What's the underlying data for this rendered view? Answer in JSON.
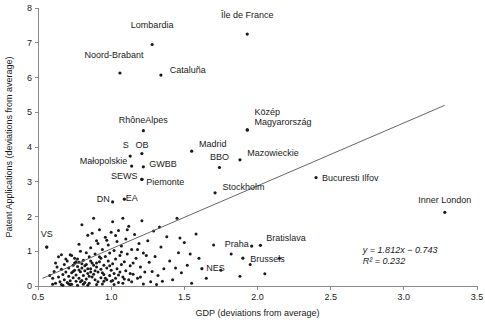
{
  "chart_data": {
    "type": "scatter",
    "title": "",
    "xlabel": "GDP (deviations from average)",
    "ylabel": "Patent Applications (deviations from average)",
    "xlim": [
      0.5,
      3.5
    ],
    "ylim": [
      0,
      8
    ],
    "xticks": [
      0.5,
      1.0,
      1.5,
      2.0,
      2.5,
      3.0,
      3.5
    ],
    "xticklabels": [
      "0.5",
      "1.0",
      "1.5",
      "2.0",
      "2.5",
      "3.0",
      "3.5"
    ],
    "yticks": [
      0,
      1,
      2,
      3,
      4,
      5,
      6,
      7,
      8
    ],
    "yticklabels": [
      "0",
      "1",
      "2",
      "3",
      "4",
      "5",
      "6",
      "7",
      "8"
    ],
    "grid": false,
    "legend": "none",
    "trendline": {
      "equation": "y = 1.812x − 0.743",
      "r2": "R² = 0.232",
      "slope": 1.812,
      "intercept": -0.743,
      "x_start": 0.53,
      "x_end": 3.28
    },
    "annotations": {
      "equation_line1": "y = 1.812x − 0.743",
      "equation_line2": "R² = 0.232"
    },
    "labeled_points": [
      {
        "label": "Île de France",
        "x": 1.93,
        "y": 7.25,
        "lx": 1.93,
        "ly": 7.72,
        "anchor": "middle"
      },
      {
        "label": "Lombardia",
        "x": 1.28,
        "y": 6.95,
        "lx": 1.28,
        "ly": 7.42,
        "anchor": "middle"
      },
      {
        "label": "Noord-Brabant",
        "x": 1.06,
        "y": 6.13,
        "lx": 1.02,
        "ly": 6.55,
        "anchor": "middle"
      },
      {
        "label": "Cataluña",
        "x": 1.34,
        "y": 6.07,
        "lx": 1.4,
        "ly": 6.13,
        "anchor": "start"
      },
      {
        "label": "Közép",
        "x": 1.93,
        "y": 4.49,
        "lx": 1.98,
        "ly": 4.92,
        "anchor": "start"
      },
      {
        "label": "Magyarország",
        "x": 1.93,
        "y": 4.49,
        "lx": 1.98,
        "ly": 4.62,
        "anchor": "start"
      },
      {
        "label": "RhôneAlpes",
        "x": 1.22,
        "y": 4.47,
        "lx": 1.22,
        "ly": 4.68,
        "anchor": "middle"
      },
      {
        "label": "Madrid",
        "x": 1.55,
        "y": 3.88,
        "lx": 1.6,
        "ly": 3.99,
        "anchor": "start"
      },
      {
        "label": "OB",
        "x": 1.21,
        "y": 3.81,
        "lx": 1.21,
        "ly": 3.98,
        "anchor": "middle"
      },
      {
        "label": "S",
        "x": 1.13,
        "y": 3.74,
        "lx": 1.1,
        "ly": 3.97,
        "anchor": "middle"
      },
      {
        "label": "Mazowieckie",
        "x": 1.88,
        "y": 3.63,
        "lx": 1.93,
        "ly": 3.74,
        "anchor": "start"
      },
      {
        "label": "BBO",
        "x": 1.74,
        "y": 3.41,
        "lx": 1.74,
        "ly": 3.62,
        "anchor": "middle"
      },
      {
        "label": "Małopolskie",
        "x": 1.14,
        "y": 3.45,
        "lx": 1.11,
        "ly": 3.5,
        "anchor": "end"
      },
      {
        "label": "GWBB",
        "x": 1.22,
        "y": 3.43,
        "lx": 1.26,
        "ly": 3.43,
        "anchor": "start"
      },
      {
        "label": "Bucuresti Ilfov",
        "x": 2.4,
        "y": 3.12,
        "lx": 2.44,
        "ly": 3.02,
        "anchor": "start"
      },
      {
        "label": "SEWS",
        "x": 1.21,
        "y": 3.07,
        "lx": 1.18,
        "ly": 3.07,
        "anchor": "end"
      },
      {
        "label": "Piemonte",
        "x": 1.21,
        "y": 3.07,
        "lx": 1.24,
        "ly": 2.92,
        "anchor": "start"
      },
      {
        "label": "Stockholm",
        "x": 1.71,
        "y": 2.68,
        "lx": 1.76,
        "ly": 2.75,
        "anchor": "start"
      },
      {
        "label": "Inner London",
        "x": 3.28,
        "y": 2.12,
        "lx": 3.28,
        "ly": 2.4,
        "anchor": "middle"
      },
      {
        "label": "EA",
        "x": 1.09,
        "y": 2.5,
        "lx": 1.1,
        "ly": 2.44,
        "anchor": "start"
      },
      {
        "label": "DN",
        "x": 1.01,
        "y": 2.42,
        "lx": 0.99,
        "ly": 2.42,
        "anchor": "end"
      },
      {
        "label": "VS",
        "x": 0.56,
        "y": 1.12,
        "lx": 0.56,
        "ly": 1.4,
        "anchor": "middle"
      },
      {
        "label": "Bratislava",
        "x": 2.02,
        "y": 1.17,
        "lx": 2.06,
        "ly": 1.3,
        "anchor": "start"
      },
      {
        "label": "Praha",
        "x": 1.96,
        "y": 1.15,
        "lx": 1.94,
        "ly": 1.11,
        "anchor": "end"
      },
      {
        "label": "Brussels",
        "x": 1.9,
        "y": 0.8,
        "lx": 1.95,
        "ly": 0.7,
        "anchor": "start"
      },
      {
        "label": "NES",
        "x": 1.62,
        "y": 0.5,
        "lx": 1.65,
        "ly": 0.42,
        "anchor": "start"
      }
    ],
    "points": [
      [
        0.56,
        1.12
      ],
      [
        0.58,
        0.3
      ],
      [
        0.6,
        0.22
      ],
      [
        0.61,
        0.42
      ],
      [
        0.62,
        0.08
      ],
      [
        0.63,
        0.55
      ],
      [
        0.64,
        0.26
      ],
      [
        0.65,
        0.12
      ],
      [
        0.66,
        0.48
      ],
      [
        0.66,
        0.04
      ],
      [
        0.67,
        0.33
      ],
      [
        0.68,
        0.62
      ],
      [
        0.68,
        0.18
      ],
      [
        0.69,
        0.4
      ],
      [
        0.7,
        0.1
      ],
      [
        0.7,
        0.72
      ],
      [
        0.71,
        0.28
      ],
      [
        0.71,
        0.52
      ],
      [
        0.72,
        0.15
      ],
      [
        0.72,
        0.9
      ],
      [
        0.73,
        0.38
      ],
      [
        0.73,
        0.05
      ],
      [
        0.74,
        0.6
      ],
      [
        0.74,
        0.24
      ],
      [
        0.75,
        0.45
      ],
      [
        0.75,
        0.8
      ],
      [
        0.76,
        0.14
      ],
      [
        0.76,
        0.32
      ],
      [
        0.77,
        0.56
      ],
      [
        0.77,
        0.02
      ],
      [
        0.78,
        0.68
      ],
      [
        0.78,
        0.22
      ],
      [
        0.79,
        1.0
      ],
      [
        0.79,
        0.41
      ],
      [
        0.8,
        0.16
      ],
      [
        0.8,
        0.52
      ],
      [
        0.8,
        1.76
      ],
      [
        0.81,
        0.3
      ],
      [
        0.81,
        0.74
      ],
      [
        0.82,
        0.1
      ],
      [
        0.82,
        0.44
      ],
      [
        0.83,
        0.62
      ],
      [
        0.83,
        0.2
      ],
      [
        0.84,
        1.46
      ],
      [
        0.84,
        0.36
      ],
      [
        0.85,
        0.84
      ],
      [
        0.85,
        0.08
      ],
      [
        0.86,
        0.5
      ],
      [
        0.86,
        1.1
      ],
      [
        0.87,
        0.26
      ],
      [
        0.87,
        0.66
      ],
      [
        0.88,
        1.95
      ],
      [
        0.88,
        0.34
      ],
      [
        0.89,
        0.18
      ],
      [
        0.89,
        0.92
      ],
      [
        0.9,
        0.55
      ],
      [
        0.9,
        1.3
      ],
      [
        0.91,
        0.12
      ],
      [
        0.91,
        0.4
      ],
      [
        0.92,
        0.7
      ],
      [
        0.92,
        1.62
      ],
      [
        0.93,
        0.24
      ],
      [
        0.93,
        0.48
      ],
      [
        0.94,
        1.05
      ],
      [
        0.94,
        0.06
      ],
      [
        0.95,
        0.6
      ],
      [
        0.95,
        0.33
      ],
      [
        0.96,
        1.4
      ],
      [
        0.96,
        0.85
      ],
      [
        0.97,
        0.18
      ],
      [
        0.97,
        0.52
      ],
      [
        0.98,
        0.72
      ],
      [
        0.98,
        1.18
      ],
      [
        0.99,
        0.3
      ],
      [
        0.99,
        0.95
      ],
      [
        1.0,
        0.45
      ],
      [
        1.0,
        1.55
      ],
      [
        1.0,
        0.14
      ],
      [
        1.01,
        0.64
      ],
      [
        1.01,
        1.85
      ],
      [
        1.02,
        0.36
      ],
      [
        1.02,
        1.02
      ],
      [
        1.03,
        0.22
      ],
      [
        1.03,
        0.78
      ],
      [
        1.04,
        1.28
      ],
      [
        1.04,
        0.5
      ],
      [
        1.05,
        1.6
      ],
      [
        1.05,
        0.1
      ],
      [
        1.06,
        0.88
      ],
      [
        1.06,
        0.4
      ],
      [
        1.07,
        1.15
      ],
      [
        1.07,
        0.62
      ],
      [
        1.08,
        0.26
      ],
      [
        1.08,
        1.95
      ],
      [
        1.09,
        0.7
      ],
      [
        1.1,
        1.35
      ],
      [
        1.1,
        0.44
      ],
      [
        1.11,
        0.92
      ],
      [
        1.12,
        0.18
      ],
      [
        1.12,
        1.72
      ],
      [
        1.13,
        0.58
      ],
      [
        1.14,
        1.05
      ],
      [
        1.15,
        0.34
      ],
      [
        1.16,
        1.48
      ],
      [
        1.17,
        0.8
      ],
      [
        1.18,
        0.22
      ],
      [
        1.19,
        1.22
      ],
      [
        1.2,
        0.55
      ],
      [
        1.21,
        1.88
      ],
      [
        1.22,
        0.95
      ],
      [
        1.23,
        0.4
      ],
      [
        1.25,
        1.3
      ],
      [
        1.26,
        0.68
      ],
      [
        1.27,
        0.12
      ],
      [
        1.29,
        1.58
      ],
      [
        1.3,
        0.85
      ],
      [
        1.32,
        0.3
      ],
      [
        1.34,
        1.12
      ],
      [
        1.36,
        0.5
      ],
      [
        1.38,
        1.42
      ],
      [
        1.4,
        0.72
      ],
      [
        1.42,
        0.18
      ],
      [
        1.45,
        1.95
      ],
      [
        1.46,
        0.96
      ],
      [
        1.48,
        0.38
      ],
      [
        1.5,
        1.25
      ],
      [
        1.52,
        0.6
      ],
      [
        1.55,
        0.08
      ],
      [
        1.58,
        1.5
      ],
      [
        1.6,
        0.8
      ],
      [
        1.65,
        0.22
      ],
      [
        1.7,
        1.18
      ],
      [
        1.75,
        0.45
      ],
      [
        1.82,
        0.92
      ],
      [
        1.88,
        0.28
      ],
      [
        1.95,
        0.62
      ],
      [
        2.05,
        0.35
      ],
      [
        2.15,
        0.8
      ],
      [
        0.62,
        0.66
      ],
      [
        0.64,
        0.84
      ],
      [
        0.67,
        0.02
      ],
      [
        0.69,
        0.78
      ],
      [
        0.71,
        0.06
      ],
      [
        0.73,
        0.88
      ],
      [
        0.75,
        0.66
      ],
      [
        0.77,
        0.78
      ],
      [
        0.79,
        0.12
      ],
      [
        0.81,
        0.05
      ],
      [
        0.83,
        0.96
      ],
      [
        0.85,
        0.28
      ],
      [
        0.87,
        1.52
      ],
      [
        0.89,
        0.44
      ],
      [
        0.91,
        1.22
      ],
      [
        0.93,
        0.8
      ],
      [
        0.95,
        0.14
      ],
      [
        0.97,
        1.32
      ],
      [
        0.99,
        0.58
      ],
      [
        1.01,
        0.16
      ],
      [
        1.03,
        1.45
      ],
      [
        1.05,
        0.32
      ],
      [
        1.07,
        0.98
      ],
      [
        1.09,
        0.2
      ],
      [
        1.11,
        1.62
      ],
      [
        1.13,
        0.36
      ],
      [
        1.15,
        0.66
      ],
      [
        1.18,
        1.05
      ],
      [
        1.2,
        0.26
      ],
      [
        1.24,
        0.88
      ],
      [
        1.28,
        0.42
      ],
      [
        1.33,
        1.7
      ],
      [
        1.35,
        0.14
      ],
      [
        1.44,
        0.52
      ],
      [
        1.47,
        1.38
      ],
      [
        1.54,
        0.92
      ],
      [
        0.6,
        0.05
      ],
      [
        0.66,
        0.9
      ],
      [
        0.72,
        0.04
      ],
      [
        0.78,
        1.2
      ],
      [
        0.84,
        0.02
      ],
      [
        0.9,
        0.04
      ],
      [
        0.96,
        0.22
      ],
      [
        1.02,
        0.04
      ],
      [
        1.08,
        0.08
      ],
      [
        1.14,
        0.12
      ],
      [
        1.22,
        0.06
      ],
      [
        1.31,
        0.04
      ],
      [
        0.86,
        0.72
      ],
      [
        0.88,
        0.6
      ],
      [
        0.9,
        0.66
      ],
      [
        0.92,
        0.84
      ],
      [
        0.94,
        0.38
      ],
      [
        0.86,
        0.4
      ],
      [
        0.84,
        0.5
      ],
      [
        0.82,
        0.58
      ],
      [
        0.8,
        0.64
      ],
      [
        0.78,
        0.46
      ],
      [
        0.76,
        0.7
      ],
      [
        0.74,
        0.42
      ]
    ]
  }
}
